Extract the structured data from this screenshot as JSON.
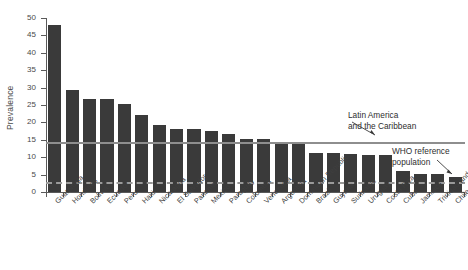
{
  "chart_data": {
    "type": "bar",
    "title": "",
    "subtitle": "",
    "xlabel": "",
    "ylabel": "Prevalence",
    "ylim": [
      0,
      50
    ],
    "yticks": [
      0,
      5,
      10,
      15,
      20,
      25,
      30,
      35,
      40,
      45,
      50
    ],
    "ytick_labels": [
      "0",
      "5",
      "10",
      "15",
      "20",
      "25",
      "30",
      "35",
      "40",
      "45",
      "50"
    ],
    "grid": false,
    "legend_position": "none",
    "bar_color": "#3a3a3a",
    "categories": [
      "Guatemala",
      "Honduras",
      "Bolivia",
      "Ecuador",
      "Peru",
      "Haiti",
      "Nicaragua",
      "El Salvador",
      "Panama",
      "Mexico",
      "Paraguay",
      "Colombia",
      "Venezuela",
      "Argentina",
      "Dominican Republic",
      "Brazil",
      "Guyana",
      "Suriname",
      "Uruguay",
      "Costa Rica",
      "Cuba",
      "Jamaica",
      "Trinidad and Tobago",
      "Chile"
    ],
    "values": [
      48.0,
      29.2,
      26.7,
      26.7,
      25.2,
      22.0,
      19.4,
      18.0,
      18.0,
      17.6,
      16.6,
      15.1,
      15.1,
      14.4,
      13.7,
      11.2,
      11.2,
      10.9,
      10.5,
      10.5,
      6.0,
      5.2,
      5.2,
      4.2
    ],
    "reference_lines": [
      {
        "name": "Latin America and the Caribbean",
        "label": "Latin America\nand the Caribbean",
        "value": 14.4,
        "style": "solid",
        "color": "#8e8e8e"
      },
      {
        "name": "WHO reference population",
        "label": "WHO reference\npopulation",
        "value": 3.0,
        "style": "dashed",
        "color": "#9a9a9a"
      }
    ]
  },
  "annotations": {
    "lac": {
      "line1": "Latin America",
      "line2": "and the Caribbean"
    },
    "who": {
      "line1": "WHO reference",
      "line2": "population"
    }
  },
  "axis": {
    "y_title": "Prevalence"
  }
}
